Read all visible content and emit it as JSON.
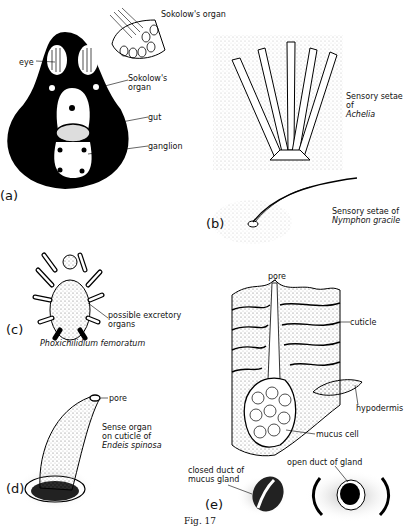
{
  "figure": {
    "caption": "Fig. 17",
    "panels": {
      "a": {
        "letter": "(a)",
        "labels": {
          "sokolow_top": "Sokolow's organ",
          "eye": "eye",
          "sokolow_mid": "Sokolow's organ",
          "gut": "gut",
          "ganglion": "ganglion"
        }
      },
      "b": {
        "letter": "(b)",
        "achelia_label_1": "Sensory setae",
        "achelia_label_2": "of",
        "achelia_label_3": "Achelia",
        "nymphon_label_1": "Sensory setae of",
        "nymphon_label_2": "Nymphon gracile"
      },
      "c": {
        "letter": "(c)",
        "organ_label_1": "possible excretory",
        "organ_label_2": "organs",
        "species": "Phoxichilidium femoratum"
      },
      "d": {
        "letter": "(d)",
        "pore": "pore",
        "label_1": "Sense organ",
        "label_2": "on cuticle of",
        "label_3": "Endeis spinosa"
      },
      "e": {
        "letter": "(e)",
        "pore": "pore",
        "cuticle": "cuticle",
        "hypodermis": "hypodermis",
        "mucus_cell": "mucus cell",
        "closed_duct_1": "closed duct of",
        "closed_duct_2": "mucus gland",
        "open_duct": "open duct of gland"
      }
    }
  }
}
